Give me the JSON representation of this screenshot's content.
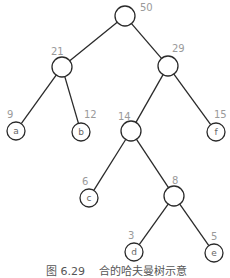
{
  "figure": {
    "caption": "图 6.29    合的哈夫曼树示意"
  },
  "tree": {
    "nodes": [
      {
        "id": "root",
        "weight": "50",
        "label": "",
        "cx": 125,
        "cy": 16,
        "r": 10,
        "wx": 140,
        "wy": 11
      },
      {
        "id": "n21",
        "weight": "21",
        "label": "",
        "cx": 62,
        "cy": 67,
        "r": 10,
        "wx": 51,
        "wy": 55
      },
      {
        "id": "n29",
        "weight": "29",
        "label": "",
        "cx": 168,
        "cy": 66,
        "r": 10,
        "wx": 172,
        "wy": 52
      },
      {
        "id": "a",
        "weight": "9",
        "label": "a",
        "cx": 16,
        "cy": 131,
        "r": 9,
        "wx": 7,
        "wy": 118
      },
      {
        "id": "b",
        "weight": "12",
        "label": "b",
        "cx": 81,
        "cy": 132,
        "r": 9,
        "wx": 84,
        "wy": 118
      },
      {
        "id": "n14",
        "weight": "14",
        "label": "",
        "cx": 131,
        "cy": 131,
        "r": 10,
        "wx": 118,
        "wy": 120
      },
      {
        "id": "f",
        "weight": "15",
        "label": "f",
        "cx": 216,
        "cy": 132,
        "r": 9,
        "wx": 214,
        "wy": 118
      },
      {
        "id": "c",
        "weight": "6",
        "label": "c",
        "cx": 89,
        "cy": 198,
        "r": 9,
        "wx": 82,
        "wy": 185
      },
      {
        "id": "n8",
        "weight": "8",
        "label": "",
        "cx": 174,
        "cy": 196,
        "r": 10,
        "wx": 172,
        "wy": 184
      },
      {
        "id": "d",
        "weight": "3",
        "label": "d",
        "cx": 134,
        "cy": 252,
        "r": 9,
        "wx": 128,
        "wy": 239
      },
      {
        "id": "e",
        "weight": "5",
        "label": "e",
        "cx": 214,
        "cy": 253,
        "r": 9,
        "wx": 211,
        "wy": 240
      }
    ],
    "edges": [
      [
        "root",
        "n21"
      ],
      [
        "root",
        "n29"
      ],
      [
        "n21",
        "a"
      ],
      [
        "n21",
        "b"
      ],
      [
        "n29",
        "n14"
      ],
      [
        "n29",
        "f"
      ],
      [
        "n14",
        "c"
      ],
      [
        "n14",
        "n8"
      ],
      [
        "n8",
        "d"
      ],
      [
        "n8",
        "e"
      ]
    ]
  }
}
